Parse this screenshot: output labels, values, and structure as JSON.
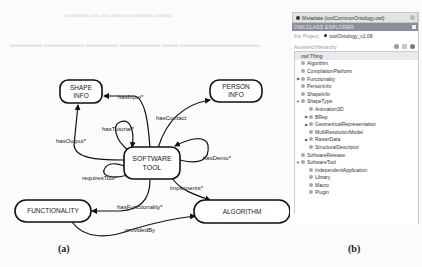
{
  "figure_a": {
    "caption": "(a)",
    "nodes": {
      "shape_info": [
        "SHAPE",
        "INFO"
      ],
      "person_info": [
        "PERSON",
        "INFO"
      ],
      "software_tool": [
        "SOFTWARE",
        "TOOL"
      ],
      "functionality": "FUNCTIONALITY",
      "algorithm": "ALGORITHM"
    },
    "edges": {
      "has_input": "hasInput*",
      "has_output": "hasOutput*",
      "has_tutorial": "hasTutorial*",
      "has_contact": "hasContact",
      "has_demo": "hasDemo*",
      "requires_tool": "requiresTool*",
      "implements": "implements*",
      "has_functionality": "hasFunctionality*",
      "provided_by": "providedBy"
    }
  },
  "figure_b": {
    "caption": "(b)",
    "tab_title": "Metadata (toolCommonOntology.owl)",
    "panel_title": "OWLCLASS EXPLORER",
    "for_project_label": "For Project:",
    "project_name": "toolOntology_v1.08",
    "hierarchy_label": "Asserted Hierarchy",
    "toolbar_icons": [
      "add-subclass-icon",
      "add-sibling-icon",
      "delete-class-icon"
    ],
    "tree": [
      {
        "label": "owl:Thing",
        "depth": 0,
        "arrow": "",
        "root": true
      },
      {
        "label": "Algorithm",
        "depth": 1,
        "arrow": ""
      },
      {
        "label": "CompilationPlatform",
        "depth": 1,
        "arrow": ""
      },
      {
        "label": "Functionality",
        "depth": 1,
        "arrow": "▶"
      },
      {
        "label": "PersonInfo",
        "depth": 1,
        "arrow": ""
      },
      {
        "label": "ShapeInfo",
        "depth": 1,
        "arrow": ""
      },
      {
        "label": "ShapeType",
        "depth": 1,
        "arrow": "▼"
      },
      {
        "label": "Animation3D",
        "depth": 2,
        "arrow": ""
      },
      {
        "label": "BRep",
        "depth": 2,
        "arrow": "▶"
      },
      {
        "label": "GeometricalRepresentation",
        "depth": 2,
        "arrow": "▶"
      },
      {
        "label": "MultiResolutionModel",
        "depth": 2,
        "arrow": ""
      },
      {
        "label": "RasterData",
        "depth": 2,
        "arrow": "▶"
      },
      {
        "label": "StructuralDescriptor",
        "depth": 2,
        "arrow": ""
      },
      {
        "label": "SoftwareRelease",
        "depth": 1,
        "arrow": ""
      },
      {
        "label": "SoftwareTool",
        "depth": 1,
        "arrow": "▼"
      },
      {
        "label": "IndependentApplication",
        "depth": 2,
        "arrow": ""
      },
      {
        "label": "Library",
        "depth": 2,
        "arrow": ""
      },
      {
        "label": "Macro",
        "depth": 2,
        "arrow": ""
      },
      {
        "label": "Plugin",
        "depth": 2,
        "arrow": ""
      }
    ]
  }
}
